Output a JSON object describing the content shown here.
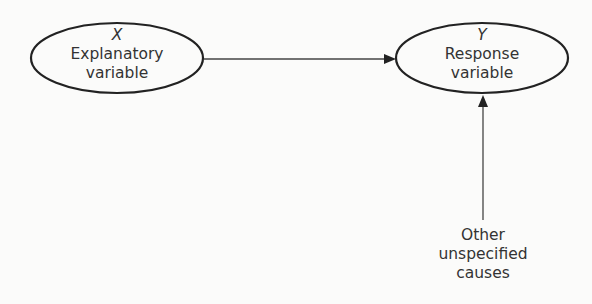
{
  "nodes": {
    "explanatory": {
      "symbol": "X",
      "line1": "Explanatory",
      "line2": "variable"
    },
    "response": {
      "symbol": "Y",
      "line1": "Response",
      "line2": "variable"
    },
    "other": {
      "line1": "Other",
      "line2": "unspecified",
      "line3": "causes"
    }
  },
  "edges": [
    {
      "from": "explanatory",
      "to": "response"
    },
    {
      "from": "other",
      "to": "response"
    }
  ],
  "colors": {
    "stroke": "#222222",
    "background": "#fbfbfa"
  }
}
